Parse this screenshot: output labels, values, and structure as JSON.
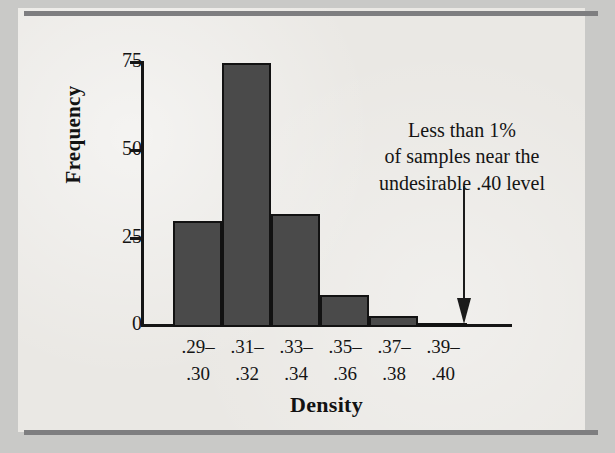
{
  "figure": {
    "caption_rules": [
      "top-rule",
      "bottom-rule"
    ]
  },
  "chart_data": {
    "type": "bar",
    "title": "",
    "subtitle": "",
    "xlabel": "Density",
    "ylabel": "Frequency",
    "categories": [
      ".29–.30",
      ".31–.32",
      ".33–.34",
      ".35–.36",
      ".37–.38",
      ".39–.40"
    ],
    "category_lines": [
      [
        ".29–",
        ".30"
      ],
      [
        ".31–",
        ".32"
      ],
      [
        ".33–",
        ".34"
      ],
      [
        ".35–",
        ".36"
      ],
      [
        ".37–",
        ".38"
      ],
      [
        ".39–",
        ".40"
      ]
    ],
    "values": [
      30,
      75,
      32,
      9,
      3,
      1
    ],
    "ylim": [
      0,
      75
    ],
    "yticks": [
      0,
      25,
      50,
      75
    ],
    "ytick_labels": [
      "0",
      "25",
      "50",
      "75"
    ],
    "grid": false,
    "legend": "none",
    "bar_fill_color": "#4a4a4a",
    "bar_edge_color": "#121212",
    "annotations": [
      {
        "name": "low-sample-callout",
        "lines": [
          "Less than 1%",
          "of samples near the",
          "undesirable .40 level"
        ],
        "text": "Less than 1% of samples near the undesirable .40 level",
        "arrow": "down-arrow",
        "points_to_category": ".39–.40"
      }
    ]
  },
  "colors": {
    "page_background": "#c9c9c7",
    "panel_background": "#eceae6",
    "rule": "#7e7e80",
    "axis": "#151515",
    "text": "#141414",
    "bar_fill": "#4a4a4a",
    "bar_edge": "#121212"
  }
}
